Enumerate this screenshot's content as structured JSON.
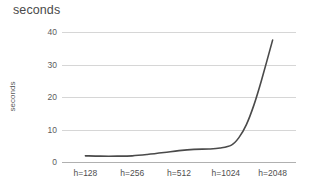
{
  "chart_data": {
    "type": "line",
    "title": "seconds",
    "xlabel": "",
    "ylabel": "seconds",
    "categories": [
      "h=128",
      "h=256",
      "h=512",
      "h=1024",
      "h=2048"
    ],
    "series": [
      {
        "name": "seconds",
        "values": [
          1.9,
          1.9,
          3.8,
          4.6,
          37.5
        ]
      }
    ],
    "dense_x": [
      0,
      0.08,
      0.17,
      0.25,
      0.33,
      0.42,
      0.5,
      0.58,
      0.66,
      0.72,
      0.78,
      0.82,
      0.86,
      0.9,
      0.94,
      1
    ],
    "dense_y": [
      1.9,
      1.8,
      1.8,
      1.9,
      2.3,
      2.9,
      3.5,
      3.9,
      4.0,
      4.3,
      5.2,
      7.5,
      11.5,
      17.5,
      25.0,
      37.5
    ],
    "ylim": [
      0,
      40
    ],
    "yticks": [
      0,
      10,
      20,
      30,
      40
    ],
    "ytick_labels": [
      "0",
      "10",
      "20",
      "30",
      "40"
    ],
    "grid": true,
    "legend": "none",
    "line_color": "#4a4a4a",
    "grid_color": "#d6d6d6",
    "axis_color": "#b0b0b0",
    "text_color": "#5c5c5c",
    "background": "#ffffff"
  }
}
